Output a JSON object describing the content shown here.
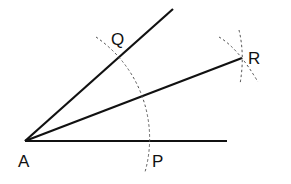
{
  "diagram": {
    "points": {
      "A": {
        "label": "A",
        "x": 25,
        "y": 141
      },
      "P": {
        "label": "P",
        "x": 148,
        "y": 141
      },
      "Q": {
        "label": "Q",
        "x": 118,
        "y": 57
      },
      "R": {
        "label": "R",
        "x": 242,
        "y": 58
      }
    },
    "segments": [
      {
        "from": "A",
        "to_xy": [
          227,
          141
        ],
        "desc": "ray AP"
      },
      {
        "from": "A",
        "to_xy": [
          173,
          9
        ],
        "desc": "ray AQ"
      },
      {
        "from": "A",
        "to": "R",
        "desc": "bisector AR"
      }
    ],
    "arcs": [
      {
        "center": "A",
        "radius": 123,
        "style": "dashed",
        "desc": "arc through P and Q"
      },
      {
        "near": "R",
        "style": "dashed",
        "desc": "intersecting arcs locating R"
      }
    ],
    "colors": {
      "line": "#111111",
      "arc": "#666666",
      "background": "#ffffff"
    }
  }
}
